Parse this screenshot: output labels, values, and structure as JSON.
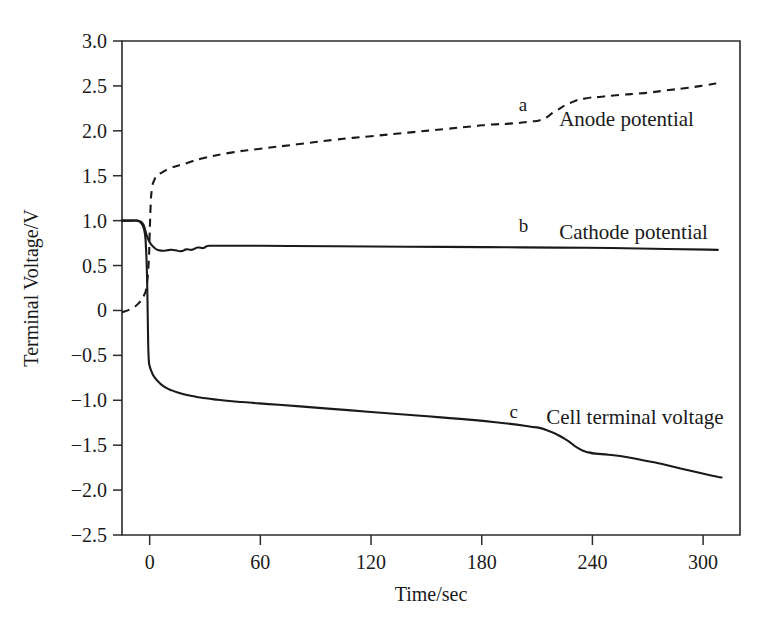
{
  "chart_data": {
    "type": "line",
    "title": "",
    "xlabel": "Time/sec",
    "ylabel": "Terminal Voltage/V",
    "xlim": [
      -15,
      320
    ],
    "ylim": [
      -2.5,
      3.0
    ],
    "grid": false,
    "legend_position": "inline-annotations",
    "xticks": [
      "0",
      "60",
      "120",
      "180",
      "240",
      "300"
    ],
    "xtick_values": [
      0,
      60,
      120,
      180,
      240,
      300
    ],
    "yticks": [
      "3.0",
      "2.5",
      "2.0",
      "1.5",
      "1.0",
      "0.5",
      "0",
      "−0.5",
      "−1.0",
      "−1.5",
      "−2.0",
      "−2.5"
    ],
    "ytick_values": [
      3.0,
      2.5,
      2.0,
      1.5,
      1.0,
      0.5,
      0.0,
      -0.5,
      -1.0,
      -1.5,
      -2.0,
      -2.5
    ],
    "series": [
      {
        "key": "a",
        "name": "Anode potential",
        "style": "dashed",
        "points": [
          [
            -15,
            -0.02
          ],
          [
            -10,
            0.02
          ],
          [
            -6,
            0.08
          ],
          [
            -3,
            0.17
          ],
          [
            -1.5,
            0.3
          ],
          [
            -0.5,
            0.55
          ],
          [
            0,
            0.85
          ],
          [
            0.5,
            1.15
          ],
          [
            1.2,
            1.35
          ],
          [
            2.5,
            1.45
          ],
          [
            4,
            1.5
          ],
          [
            7,
            1.54
          ],
          [
            12,
            1.59
          ],
          [
            20,
            1.64
          ],
          [
            30,
            1.7
          ],
          [
            45,
            1.76
          ],
          [
            60,
            1.8
          ],
          [
            80,
            1.85
          ],
          [
            100,
            1.9
          ],
          [
            120,
            1.94
          ],
          [
            140,
            1.98
          ],
          [
            160,
            2.02
          ],
          [
            175,
            2.05
          ],
          [
            185,
            2.07
          ],
          [
            195,
            2.08
          ],
          [
            205,
            2.1
          ],
          [
            213,
            2.13
          ],
          [
            220,
            2.22
          ],
          [
            228,
            2.31
          ],
          [
            236,
            2.36
          ],
          [
            245,
            2.38
          ],
          [
            255,
            2.4
          ],
          [
            268,
            2.42
          ],
          [
            280,
            2.45
          ],
          [
            292,
            2.48
          ],
          [
            302,
            2.51
          ],
          [
            308,
            2.53
          ]
        ]
      },
      {
        "key": "b",
        "name": "Cathode potential",
        "style": "solid",
        "points": [
          [
            -15,
            1.0
          ],
          [
            -10,
            1.0
          ],
          [
            -7,
            1.0
          ],
          [
            -5,
            0.99
          ],
          [
            -3.5,
            0.96
          ],
          [
            -2.5,
            0.9
          ],
          [
            -1.5,
            0.83
          ],
          [
            -0.5,
            0.78
          ],
          [
            1,
            0.73
          ],
          [
            3,
            0.69
          ],
          [
            5,
            0.67
          ],
          [
            8,
            0.665
          ],
          [
            11,
            0.675
          ],
          [
            14,
            0.67
          ],
          [
            17,
            0.66
          ],
          [
            20,
            0.68
          ],
          [
            23,
            0.675
          ],
          [
            26,
            0.7
          ],
          [
            29,
            0.695
          ],
          [
            31,
            0.715
          ],
          [
            34,
            0.72
          ],
          [
            40,
            0.72
          ],
          [
            60,
            0.72
          ],
          [
            100,
            0.715
          ],
          [
            140,
            0.71
          ],
          [
            180,
            0.705
          ],
          [
            220,
            0.7
          ],
          [
            250,
            0.695
          ],
          [
            280,
            0.685
          ],
          [
            308,
            0.675
          ]
        ]
      },
      {
        "key": "c",
        "name": "Cell terminal voltage",
        "style": "solid",
        "points": [
          [
            -15,
            1.0
          ],
          [
            -10,
            1.0
          ],
          [
            -7,
            1.0
          ],
          [
            -5,
            0.98
          ],
          [
            -3.5,
            0.93
          ],
          [
            -2.5,
            0.84
          ],
          [
            -2.0,
            0.7
          ],
          [
            -1.6,
            0.5
          ],
          [
            -1.3,
            0.25
          ],
          [
            -1.1,
            0.0
          ],
          [
            -0.9,
            -0.25
          ],
          [
            -0.7,
            -0.45
          ],
          [
            -0.4,
            -0.57
          ],
          [
            0,
            -0.62
          ],
          [
            1,
            -0.68
          ],
          [
            2.5,
            -0.74
          ],
          [
            5,
            -0.8
          ],
          [
            8,
            -0.85
          ],
          [
            12,
            -0.89
          ],
          [
            18,
            -0.93
          ],
          [
            25,
            -0.96
          ],
          [
            35,
            -0.99
          ],
          [
            50,
            -1.02
          ],
          [
            70,
            -1.05
          ],
          [
            95,
            -1.09
          ],
          [
            120,
            -1.13
          ],
          [
            145,
            -1.17
          ],
          [
            170,
            -1.21
          ],
          [
            190,
            -1.25
          ],
          [
            205,
            -1.29
          ],
          [
            215,
            -1.33
          ],
          [
            225,
            -1.43
          ],
          [
            232,
            -1.53
          ],
          [
            238,
            -1.58
          ],
          [
            245,
            -1.6
          ],
          [
            255,
            -1.62
          ],
          [
            268,
            -1.67
          ],
          [
            280,
            -1.72
          ],
          [
            292,
            -1.78
          ],
          [
            305,
            -1.84
          ],
          [
            310,
            -1.86
          ]
        ]
      }
    ],
    "annotations": [
      {
        "text": "a",
        "x": 200,
        "y": 2.22
      },
      {
        "text": "Anode potential",
        "x": 222,
        "y": 2.05
      },
      {
        "text": "b",
        "x": 200,
        "y": 0.87
      },
      {
        "text": "Cathode potential",
        "x": 222,
        "y": 0.8
      },
      {
        "text": "c",
        "x": 195,
        "y": -1.2
      },
      {
        "text": "Cell terminal voltage",
        "x": 215,
        "y": -1.26
      }
    ]
  }
}
